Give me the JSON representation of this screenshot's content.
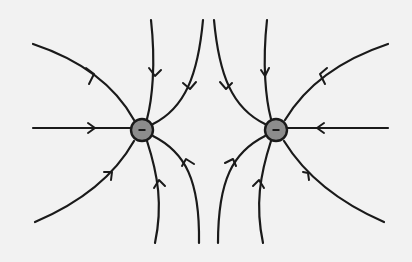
{
  "diagram": {
    "colors": {
      "background": "#f2f2f2",
      "line": "#1a1a1a",
      "charge_fill": "#8c8c8c"
    },
    "charges": [
      {
        "id": "left",
        "sign": "−",
        "type": "negative",
        "cx": 142,
        "cy": 130,
        "r": 11
      },
      {
        "id": "right",
        "sign": "−",
        "type": "negative",
        "cx": 276,
        "cy": 130,
        "r": 11
      }
    ],
    "field_lines": [
      {
        "charge": "left",
        "d": "M33,44 C75,58 112,80 134,120"
      },
      {
        "charge": "left",
        "d": "M33,128 L131,128"
      },
      {
        "charge": "left",
        "d": "M35,222 C75,205 112,180 134,141"
      },
      {
        "charge": "left",
        "d": "M151,20 C156,65 152,100 147,119"
      },
      {
        "charge": "left",
        "d": "M203,20 C198,75 185,108 153,124"
      },
      {
        "charge": "left",
        "d": "M147,141 C158,175 163,205 155,243"
      },
      {
        "charge": "left",
        "d": "M153,136 C185,152 200,180 199,243"
      },
      {
        "charge": "right",
        "d": "M388,44 C346,58 309,80 285,120"
      },
      {
        "charge": "right",
        "d": "M388,128 L287,128"
      },
      {
        "charge": "right",
        "d": "M384,222 C345,205 308,180 284,141"
      },
      {
        "charge": "right",
        "d": "M267,20 C262,65 266,100 271,119"
      },
      {
        "charge": "right",
        "d": "M214,20 C219,75 232,108 265,124"
      },
      {
        "charge": "right",
        "d": "M271,141 C260,175 255,205 263,243"
      },
      {
        "charge": "right",
        "d": "M265,136 C233,152 218,180 218,243"
      }
    ],
    "arrows": [
      {
        "d": "M86,68 L94,74 L89,84"
      },
      {
        "d": "M88,123 L95,128 L88,133"
      },
      {
        "d": "M104,172 L112,172 L111,180"
      },
      {
        "d": "M149,68 L155,76 L161,70"
      },
      {
        "d": "M183,83 L190,89 L196,82"
      },
      {
        "d": "M154,188 L159,180 L165,186"
      },
      {
        "d": "M182,166 L186,159 L194,164"
      },
      {
        "d": "M327,68 L320,74 L325,84"
      },
      {
        "d": "M324,123 L317,128 L324,133"
      },
      {
        "d": "M303,172 L308,173 L309,180"
      },
      {
        "d": "M261,70 L265,76 L269,68"
      },
      {
        "d": "M220,82 L226,89 L232,83"
      },
      {
        "d": "M253,186 L259,180 L264,188"
      },
      {
        "d": "M225,163 L233,159 L236,166"
      }
    ]
  }
}
